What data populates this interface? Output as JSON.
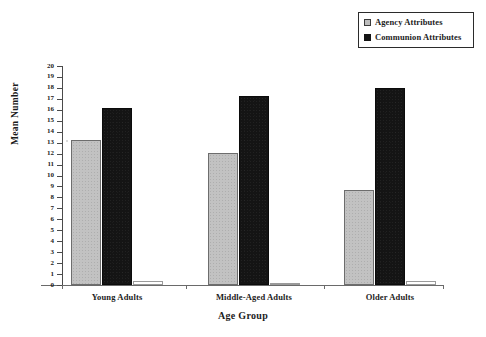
{
  "chart_data": {
    "type": "bar",
    "title": "",
    "subtitle": "",
    "xlabel": "Age Group",
    "ylabel": "Mean Number",
    "categories": [
      "Young Adults",
      "Middle-Aged Adults",
      "Older Adults"
    ],
    "series": [
      {
        "name": "Agency Attributes",
        "values": [
          13.2,
          12.1,
          8.7
        ],
        "color": "#c2c2c2"
      },
      {
        "name": "Communion Attributes",
        "values": [
          16.2,
          17.3,
          18.0
        ],
        "color": "#141414"
      },
      {
        "name": "",
        "values": [
          0.4,
          0.2,
          0.4
        ],
        "color": "#ffffff"
      }
    ],
    "ylim": [
      0,
      20
    ],
    "ytick_step": 1,
    "ytick_labels": [
      "20",
      "19",
      "18",
      "17",
      "16",
      "15",
      "14",
      "13",
      "12",
      "11",
      "10",
      "9",
      "8",
      "7",
      "6",
      "5",
      "4",
      "3",
      "2",
      "1",
      "0"
    ],
    "grid": false,
    "legend_position": "top-right",
    "legend_entries": [
      "Agency Attributes",
      "Communion Attributes"
    ]
  },
  "legend": {
    "items": [
      {
        "label": "Agency Attributes",
        "swatch": "light-gray-square-icon"
      },
      {
        "label": "Communion Attributes",
        "swatch": "black-square-icon"
      }
    ]
  },
  "axes": {
    "y_title": "Mean Number",
    "x_title": "Age Group"
  }
}
